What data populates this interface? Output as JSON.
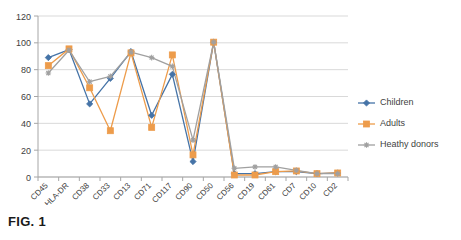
{
  "figure": {
    "caption": "FIG. 1"
  },
  "chart_data": {
    "type": "line",
    "title": "",
    "xlabel": "",
    "ylabel": "",
    "ylim": [
      0,
      120
    ],
    "ytick_values": [
      0,
      20,
      40,
      60,
      80,
      100,
      120
    ],
    "ytick_labels": [
      "0",
      "20",
      "40",
      "60",
      "80",
      "100",
      "120"
    ],
    "grid": true,
    "grid_axis": "y",
    "legend_position": "right",
    "categories": [
      "CD45",
      "HLA-DR",
      "CD38",
      "CD33",
      "CD13",
      "CD71",
      "CD117",
      "CD90",
      "CD50",
      "CD56",
      "CD19",
      "CD61",
      "CD7",
      "CD10",
      "CD2"
    ],
    "series": [
      {
        "name": "Children",
        "color": "#4573a7",
        "marker": "diamond",
        "values": [
          89,
          95,
          54.5,
          73.5,
          93.5,
          46,
          76.5,
          11.5,
          100.5,
          2.5,
          2.5,
          4,
          4,
          2.5,
          3
        ]
      },
      {
        "name": "Adults",
        "color": "#ed9c4b",
        "marker": "square",
        "values": [
          83,
          95.5,
          66.5,
          34.5,
          92.5,
          37,
          91,
          16.5,
          100.5,
          1.5,
          1.5,
          4,
          4.5,
          2.5,
          3
        ]
      },
      {
        "name": "Heathy donors",
        "color": "#a0a0a0",
        "marker": "star",
        "values": [
          77.5,
          94.5,
          71,
          75,
          93,
          89,
          82.5,
          27.5,
          100.5,
          6.5,
          7.5,
          7.5,
          5,
          2.5,
          2.5
        ]
      }
    ]
  }
}
